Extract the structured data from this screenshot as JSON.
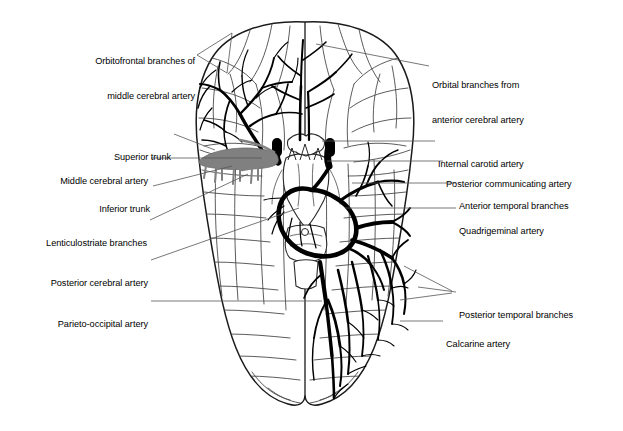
{
  "figure": {
    "view": "inferior-brain-arteries",
    "colors": {
      "background": "#ffffff",
      "outline": "#1a1a1a",
      "sulci": "#4a4a4a",
      "artery_dark": "#000000",
      "artery_gray": "#808080",
      "leader_line": "#555555"
    }
  },
  "labels_left": [
    {
      "id": "orbitofrontal-branches-of-middle-cerebral-artery",
      "lines": [
        "Orbitofrontal branches of",
        "middle cerebral artery"
      ],
      "text": "Orbitofrontal branches of middle cerebral artery",
      "x": 195,
      "y": 38,
      "leader": "M 197,55 L 232,33 L 227,73 Z"
    },
    {
      "id": "superior-trunk",
      "lines": [
        "Superior trunk"
      ],
      "text": "Superior trunk",
      "x": 171,
      "y": 130,
      "leader": "M 174,134 L 215,150"
    },
    {
      "id": "middle-cerebral-artery",
      "lines": [
        "Middle cerebral artery"
      ],
      "text": "Middle cerebral artery",
      "x": 148,
      "y": 154,
      "leader": "M 151,158 L 262,158"
    },
    {
      "id": "inferior-trunk",
      "lines": [
        "Inferior trunk"
      ],
      "text": "Inferior trunk",
      "x": 150,
      "y": 182,
      "leader": "M 153,186 L 232,166"
    },
    {
      "id": "lenticulostriate-branches",
      "lines": [
        "Lenticulostriate branches"
      ],
      "text": "Lenticulostriate branches",
      "x": 147,
      "y": 216,
      "leader": "M 150,220 L 248,174"
    },
    {
      "id": "posterior-cerebral-artery",
      "lines": [
        "Posterior cerebral artery"
      ],
      "text": "Posterior cerebral artery",
      "x": 148,
      "y": 256,
      "leader": "M 151,260 L 299,208"
    },
    {
      "id": "parieto-occipital-artery",
      "lines": [
        "Parieto-occipital artery"
      ],
      "text": "Parieto-occipital artery",
      "x": 148,
      "y": 297,
      "leader": "M 151,301 L 322,301"
    }
  ],
  "labels_right": [
    {
      "id": "orbital-branches-from-anterior-cerebral-artery",
      "lines": [
        "Orbital branches from",
        "anterior cerebral artery"
      ],
      "text": "Orbital branches from anterior cerebral artery",
      "x": 432,
      "y": 62,
      "leader": "M 429,66 L 316,44"
    },
    {
      "id": "internal-carotid-artery",
      "lines": [
        "Internal carotid artery"
      ],
      "text": "Internal carotid artery",
      "x": 438,
      "y": 137,
      "leader": "M 435,141 L 322,141"
    },
    {
      "id": "posterior-communicating-artery",
      "lines": [
        "Posterior communicating artery"
      ],
      "text": "Posterior communicating artery",
      "x": 446,
      "y": 157,
      "leader": "M 443,161 L 327,161"
    },
    {
      "id": "anterior-temporal-branches",
      "lines": [
        "Anterior temporal branches"
      ],
      "text": "Anterior temporal branches",
      "x": 459,
      "y": 179,
      "leader": "M 456,183 L 352,183"
    },
    {
      "id": "quadrigeminal-artery",
      "lines": [
        "Quadrigeminal artery"
      ],
      "text": "Quadrigeminal artery",
      "x": 459,
      "y": 204,
      "leader": "M 456,208 L 345,208"
    },
    {
      "id": "posterior-temporal-branches",
      "lines": [
        "Posterior temporal branches"
      ],
      "text": "Posterior temporal branches",
      "x": 459,
      "y": 288,
      "leader": "M 456,292 L 418,287 M 456,292 L 404,266 M 456,292 L 400,299"
    },
    {
      "id": "calcarine-artery",
      "lines": [
        "Calcarine artery"
      ],
      "text": "Calcarine artery",
      "x": 446,
      "y": 317,
      "leader": "M 443,321 L 400,321"
    }
  ]
}
